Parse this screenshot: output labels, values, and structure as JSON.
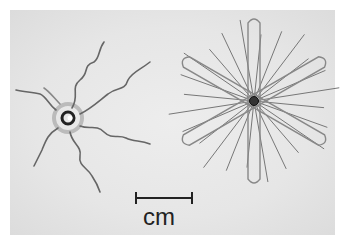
{
  "figure": {
    "scale_bar": {
      "label": "cm",
      "length_units": 1
    },
    "objects": [
      {
        "name": "spiral-wire-device",
        "arms": 6
      },
      {
        "name": "star-wire-device",
        "loops": 6
      }
    ],
    "colors": {
      "background": "#e6e6e6",
      "wire": "#555555",
      "text": "#222222"
    }
  }
}
